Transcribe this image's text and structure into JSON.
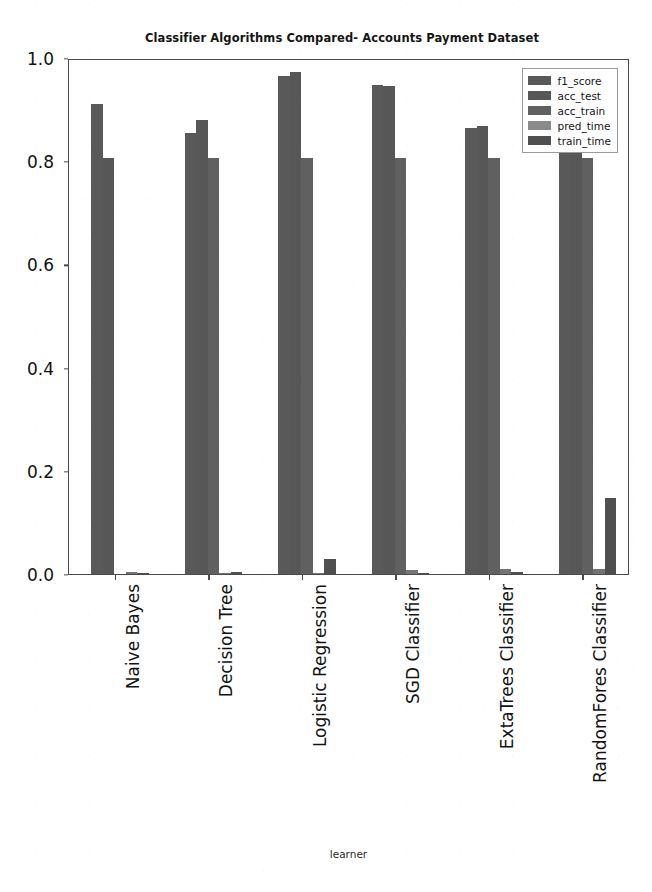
{
  "chart_data": {
    "type": "bar",
    "title": "Classifier Algorithms Compared- Accounts Payment Dataset",
    "xlabel": "learner",
    "ylabel": "",
    "ylim": [
      0.0,
      1.0
    ],
    "grid": false,
    "legend_position": "upper right",
    "categories": [
      "Naive Bayes",
      "Decision Tree",
      "Logistic Regression",
      "SGD Classifier",
      "ExtaTrees Classifier",
      "RandomFores Classifier"
    ],
    "ytick_labels": [
      "0.0",
      "0.2",
      "0.4",
      "0.6",
      "0.8",
      "1.0"
    ],
    "ytick_values": [
      0.0,
      0.2,
      0.4,
      0.6,
      0.8,
      1.0
    ],
    "series": [
      {
        "name": "f1_score",
        "color": "#595959",
        "values": [
          0.91,
          0.855,
          0.965,
          0.947,
          0.864,
          0.905
        ]
      },
      {
        "name": "acc_test",
        "color": "#575757",
        "values": [
          0.807,
          0.879,
          0.972,
          0.945,
          0.869,
          0.931
        ]
      },
      {
        "name": "acc_train",
        "color": "#606060",
        "values": [
          0.0,
          0.807,
          0.807,
          0.807,
          0.807,
          0.807
        ]
      },
      {
        "name": "pred_time",
        "color": "#747474",
        "values": [
          0.003,
          0.002,
          0.002,
          0.008,
          0.01,
          0.01
        ]
      },
      {
        "name": "train_time",
        "color": "#4f4f4f",
        "values": [
          0.002,
          0.003,
          0.03,
          0.002,
          0.003,
          0.147
        ]
      }
    ]
  },
  "legend": {
    "entries": [
      {
        "label": "f1_score",
        "color": "#595959"
      },
      {
        "label": "acc_test",
        "color": "#575757"
      },
      {
        "label": "acc_train",
        "color": "#606060"
      },
      {
        "label": "pred_time",
        "color": "#8a8a8a"
      },
      {
        "label": "train_time",
        "color": "#4f4f4f"
      }
    ]
  }
}
